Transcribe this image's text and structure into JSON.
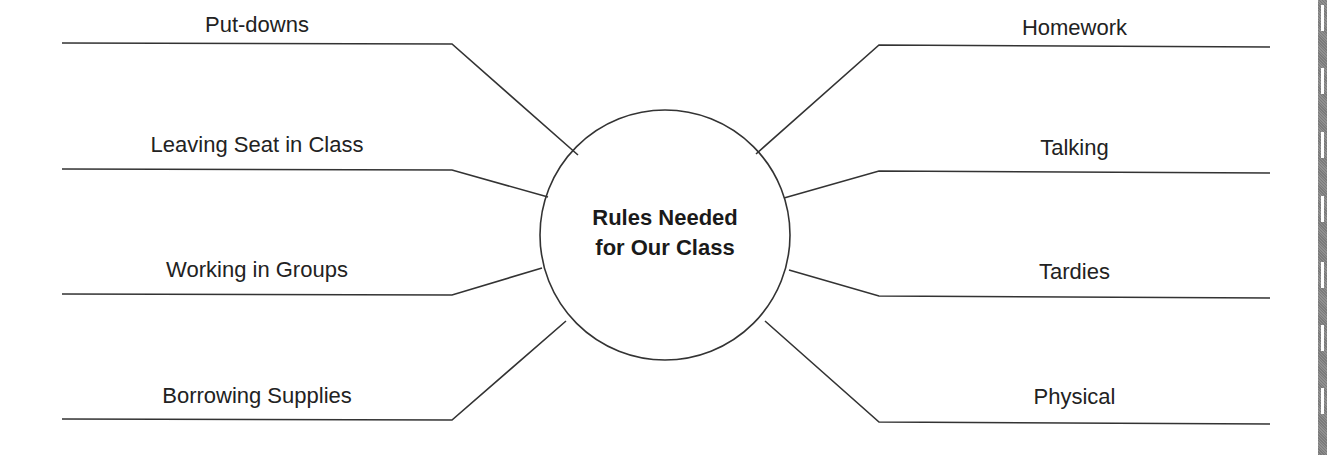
{
  "diagram": {
    "type": "web-organizer",
    "center": {
      "line1": "Rules Needed",
      "line2": "for Our Class"
    },
    "left_branches": [
      {
        "label": "Put-downs"
      },
      {
        "label": "Leaving Seat in Class"
      },
      {
        "label": "Working in Groups"
      },
      {
        "label": "Borrowing Supplies"
      }
    ],
    "right_branches": [
      {
        "label": "Homework"
      },
      {
        "label": "Talking"
      },
      {
        "label": "Tardies"
      },
      {
        "label": "Physical"
      }
    ],
    "colors": {
      "line": "#333333",
      "text": "#222222",
      "background": "#ffffff",
      "edge_bar": "#858585"
    }
  }
}
